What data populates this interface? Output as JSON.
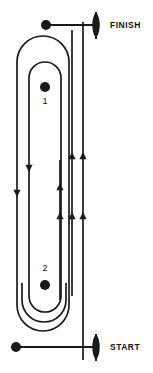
{
  "diagram": {
    "type": "track-loop-schematic",
    "stroke_color": "#1a1a1a",
    "fill_color": "#ffffff",
    "background": "#ffffff",
    "width": 153,
    "height": 373
  },
  "markers": {
    "finish": {
      "label": "FINISH",
      "icon": "flag-icon",
      "y": 25
    },
    "start": {
      "label": "START",
      "icon": "flag-icon",
      "y": 347
    }
  },
  "zones": [
    {
      "id": "zone-1",
      "label": "1",
      "dot": "marker-dot",
      "dot_position": "above-label"
    },
    {
      "id": "zone-2",
      "label": "2",
      "dot": "marker-dot",
      "dot_position": "below-label"
    }
  ],
  "reference_dots": [
    {
      "name": "finish-reference-dot",
      "x": 46,
      "y": 25
    },
    {
      "name": "start-reference-dot",
      "x": 16,
      "y": 347
    }
  ],
  "lanes": [
    {
      "name": "outer-lane",
      "x_left": 17,
      "x_right": 83,
      "direction": "down-left-up-right"
    },
    {
      "name": "middle-lane",
      "x_left": 29,
      "x_right": 72,
      "direction": "down-left-up-right"
    },
    {
      "name": "inner-lane",
      "x_left": 60,
      "x_right": 60,
      "direction": "up"
    }
  ],
  "arrows": [
    {
      "name": "arrow-down-outer",
      "x": 17,
      "y": 190,
      "direction": "down"
    },
    {
      "name": "arrow-down-middle",
      "x": 29,
      "y": 165,
      "direction": "down"
    },
    {
      "name": "arrow-up-a",
      "x": 60,
      "y": 183,
      "direction": "up"
    },
    {
      "name": "arrow-up-b",
      "x": 72,
      "y": 155,
      "direction": "up"
    },
    {
      "name": "arrow-up-c",
      "x": 83,
      "y": 155,
      "direction": "up"
    },
    {
      "name": "arrow-up-d",
      "x": 60,
      "y": 215,
      "direction": "up"
    },
    {
      "name": "arrow-up-e",
      "x": 72,
      "y": 215,
      "direction": "up"
    },
    {
      "name": "arrow-up-f",
      "x": 83,
      "y": 215,
      "direction": "up"
    }
  ]
}
